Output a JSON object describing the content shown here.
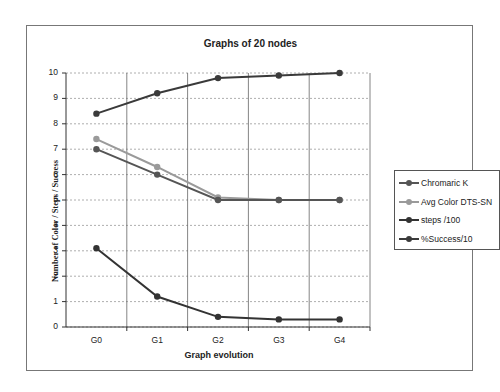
{
  "chart_data": {
    "type": "line",
    "title": "Graphs of 20 nodes",
    "xlabel": "Graph evolution",
    "ylabel": "Number of Color / Steps / Success",
    "categories": [
      "G0",
      "G1",
      "G2",
      "G3",
      "G4"
    ],
    "ylim": [
      0,
      10
    ],
    "yticks": [
      "0",
      "1",
      "2",
      "3",
      "4",
      "5",
      "6",
      "7",
      "8",
      "9",
      "10"
    ],
    "grid": {
      "horizontal": "dotted",
      "vertical": "solid-between-categories"
    },
    "legend_position": "right",
    "series": [
      {
        "name": "Chromaric K",
        "color": "#555555",
        "values": [
          7,
          6,
          5,
          5,
          5
        ]
      },
      {
        "name": "Avg Color DTS-SN",
        "color": "#9a9a9a",
        "values": [
          7.4,
          6.3,
          5.1,
          5,
          5
        ]
      },
      {
        "name": "steps /100",
        "color": "#333333",
        "values": [
          3.1,
          1.2,
          0.4,
          0.3,
          0.3
        ]
      },
      {
        "name": "%Success/10",
        "color": "#3a3a3a",
        "values": [
          8.4,
          9.2,
          9.8,
          9.9,
          10
        ]
      }
    ]
  }
}
